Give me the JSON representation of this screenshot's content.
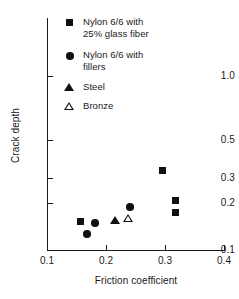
{
  "chart_data": {
    "type": "scatter",
    "title": "",
    "xlabel": "Friction coefficient",
    "ylabel": "Crack depth",
    "xscale": "linear",
    "yscale": "log",
    "xlim": [
      0.1,
      0.4
    ],
    "ylim": [
      0.1,
      1.4
    ],
    "grid": false,
    "legend_position": "top-center-inside",
    "xticks": [
      {
        "value": 0.1,
        "label": "0.1",
        "px": 47
      },
      {
        "value": 0.2,
        "label": "0.2",
        "px": 106
      },
      {
        "value": 0.3,
        "label": "0.3",
        "px": 165
      },
      {
        "value": 0.4,
        "label": "0.4",
        "px": 224
      }
    ],
    "yticks": [
      {
        "value": 1.0,
        "label": "1.0",
        "px": 76
      },
      {
        "value": 0.5,
        "label": "0.5",
        "px": 140
      },
      {
        "value": 0.3,
        "label": "0.3",
        "px": 178
      },
      {
        "value": 0.2,
        "label": "0.2",
        "px": 203
      },
      {
        "value": 0.1,
        "label": "0.1",
        "px": 250
      }
    ],
    "series": [
      {
        "name": "Nylon 6/6 with 25% glass fiber",
        "legend_label": "Nylon 6/6 with\n25% glass fiber",
        "marker": "square-filled",
        "color": "#111111",
        "points": [
          {
            "x": 0.155,
            "y": 0.148,
            "px": 80,
            "py": 221
          },
          {
            "x": 0.296,
            "y": 0.31,
            "px": 162,
            "py": 170
          },
          {
            "x": 0.317,
            "y": 0.195,
            "px": 175,
            "py": 200
          },
          {
            "x": 0.317,
            "y": 0.165,
            "px": 175,
            "py": 212
          }
        ]
      },
      {
        "name": "Nylon 6/6 with fillers",
        "legend_label": "Nylon 6/6 with\nfillers",
        "marker": "circle-filled",
        "color": "#111111",
        "points": [
          {
            "x": 0.168,
            "y": 0.122,
            "px": 87,
            "py": 234
          },
          {
            "x": 0.182,
            "y": 0.145,
            "px": 95,
            "py": 223
          },
          {
            "x": 0.241,
            "y": 0.177,
            "px": 130,
            "py": 207
          }
        ]
      },
      {
        "name": "Steel",
        "legend_label": "Steel",
        "marker": "triangle-filled",
        "color": "#111111",
        "points": [
          {
            "x": 0.216,
            "y": 0.151,
            "px": 115,
            "py": 220
          }
        ]
      },
      {
        "name": "Bronze",
        "legend_label": "Bronze",
        "marker": "triangle-open",
        "color": "#111111",
        "points": [
          {
            "x": 0.238,
            "y": 0.157,
            "px": 128,
            "py": 218
          }
        ]
      }
    ]
  },
  "axes": {
    "xlabel": "Friction coefficient",
    "ylabel": "Crack depth"
  },
  "legend": {
    "entries": [
      {
        "label": "Nylon 6/6 with\n25% glass fiber",
        "marker": "square-filled"
      },
      {
        "label": "Nylon 6/6 with\nfillers",
        "marker": "circle-filled"
      },
      {
        "label": "Steel",
        "marker": "triangle-filled"
      },
      {
        "label": "Bronze",
        "marker": "triangle-open"
      }
    ]
  },
  "colors": {
    "ink": "#1a1a1a",
    "marker": "#111111",
    "background": "#ffffff"
  }
}
